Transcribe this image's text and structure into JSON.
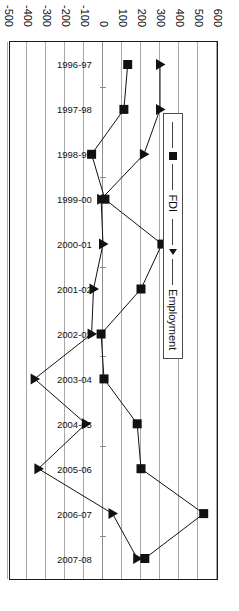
{
  "chart_data": {
    "type": "line",
    "title": "",
    "xlabel": "",
    "ylabel": "",
    "orientation": "rotated-90-clockwise",
    "grid": true,
    "legend_position": "inside-upper-left",
    "ylim": [
      -500,
      600
    ],
    "ytick_labels": [
      "600",
      "500",
      "400",
      "300",
      "200",
      "100",
      "0",
      "-100",
      "-200",
      "-300",
      "-400",
      "-500"
    ],
    "ytick_values": [
      600,
      500,
      400,
      300,
      200,
      100,
      0,
      -100,
      -200,
      -300,
      -400,
      -500
    ],
    "categories": [
      "1996-97",
      "1997-98",
      "1998-99",
      "1999-00",
      "2000-01",
      "2001-02",
      "2002-03",
      "2003-04",
      "2004-05",
      "2005-06",
      "2006-07",
      "2007-08"
    ],
    "series": [
      {
        "name": "FDI",
        "marker": "square",
        "values": [
          130,
          110,
          -60,
          10,
          310,
          200,
          -10,
          5,
          180,
          200,
          530,
          220
        ]
      },
      {
        "name": "Employment",
        "marker": "triangle",
        "values": [
          300,
          300,
          215,
          -10,
          0,
          -50,
          -60,
          -360,
          -90,
          -340,
          50,
          180
        ]
      }
    ]
  },
  "legend": {
    "items": [
      {
        "label": "FDI",
        "marker": "square"
      },
      {
        "label": "Employment",
        "marker": "triangle"
      }
    ]
  },
  "colors": {
    "series": "#111111",
    "grid": "#a8a8a8",
    "frame": "#1a1a1a",
    "text": "#111111",
    "background": "#ffffff"
  }
}
